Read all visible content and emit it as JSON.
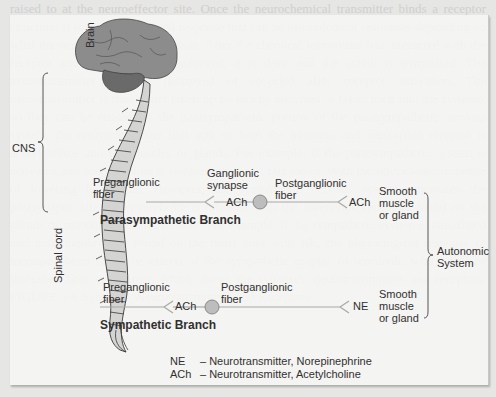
{
  "background_bleed_text": "raised to at the neuroeffector site. Once the neurochemical transmitter binds a receptor structure, it initiates the desired response that can be physiological responses depending on what the nerve innervates the tissue. After the chemical transmitter has interacted with the receptor and the response is achieved, it is done and the action is terminated. The neurotransmitter can be destroyed or recycled after receptor activation. The neurotransmitter is then either taken up by nearby enzymes or taken back into the synapse, so they can be reused. In the parasympathetic portion of the parasympathetic nervous system, the neurotransmitter that acts on both the nicotinic and muscarinic receptor is acetylcholine and the muscles or glands. For example, if the parasympathetic system is activated and acetylcholine is released, the heart rate slows. With the physiologic response of lowering heart rate. However, the sympathetic nervous system innervates the postsynaptic site, norepinephrine is released with the adrenergic receptors found on the glands or smooth or cardiac muscle. For example, if the sympathetic system is stimulated and norepinephrine is found on the heart bind with NE, the physiological response of increased heart rate. The effects of the sympathetic graphic of terminals, which will be discussed later in Chapter, which shows the synapses, neurotransmitters and receptors. FIGURE 3-8 Synapses, Neurotransmitters, and Receptors",
  "diagram": {
    "labels": {
      "brain": "Brain",
      "spinal_cord": "Spinal cord",
      "cns": "CNS",
      "autonomic_system": [
        "Autonomic",
        "System"
      ]
    },
    "parasympathetic": {
      "branch_label": "Parasympathetic Branch",
      "preganglionic": [
        "Preganglionic",
        "fiber"
      ],
      "ganglionic_synapse": [
        "Ganglionic",
        "synapse"
      ],
      "neurotransmitter_1": "ACh",
      "postganglionic": [
        "Postganglionic",
        "fiber"
      ],
      "neurotransmitter_2": "ACh",
      "target": [
        "Smooth",
        "muscle",
        "or gland"
      ]
    },
    "sympathetic": {
      "branch_label": "Sympathetic Branch",
      "preganglionic": [
        "Preganglionic",
        "fiber"
      ],
      "neurotransmitter_1": "ACh",
      "postganglionic": [
        "Postganglionic",
        "fiber"
      ],
      "neurotransmitter_2": "NE",
      "target": [
        "Smooth",
        "muscle",
        "or gland"
      ]
    },
    "legend": [
      {
        "abbr": "NE",
        "desc": "– Neurotransmitter, Norepinephrine"
      },
      {
        "abbr": "ACh",
        "desc": "– Neurotransmitter, Acetylcholine"
      }
    ],
    "colors": {
      "brain": "#8a8a8a",
      "cerebellum": "#6e6e6e",
      "spine": "#d2d2d0",
      "fiber_line": "#b0b0b0",
      "ganglion": "#bdbdbd",
      "text": "#303030"
    }
  }
}
